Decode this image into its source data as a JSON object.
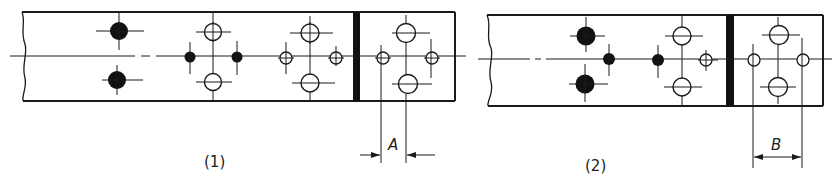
{
  "figures": [
    {
      "id": "1",
      "caption": "(1)",
      "dimension_label": "A",
      "description": "Splice plate with filled (existing) and open (new) holes; dimension A from first open hole to next centerline across joint"
    },
    {
      "id": "2",
      "caption": "(2)",
      "dimension_label": "B",
      "description": "Splice plate with filled and open holes; dimension B spans between the outer open holes beyond the joint"
    }
  ],
  "colors": {
    "line": "#1a1a1a",
    "background": "#ffffff"
  }
}
